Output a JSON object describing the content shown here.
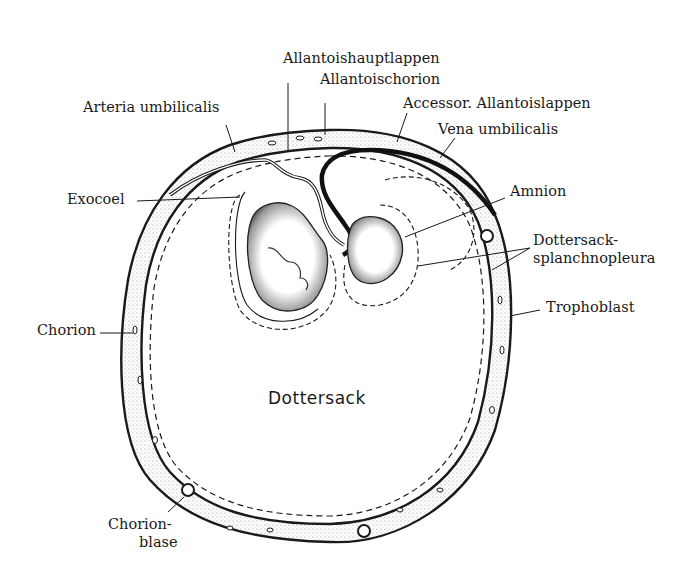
{
  "figure": {
    "type": "anatomical-section-diagram",
    "center_label": "Dottersack"
  },
  "labels": {
    "allantoishauptlappen": "Allantoishauptlappen",
    "allantoischorion": "Allantoischorion",
    "accessor_allantoislappen": "Accessor. Allantoislappen",
    "vena_umbilicalis": "Vena  umbilicalis",
    "arteria_umbilicalis": "Arteria umbilicalis",
    "exocoel": "Exocoel",
    "amnion": "Amnion",
    "dottersack_splanchnopleura_1": "Dottersack-",
    "dottersack_splanchnopleura_2": "splanchnopleura",
    "trophoblast": "Trophoblast",
    "chorion": "Chorion",
    "chorionblase_1": "Chorion-",
    "chorionblase_2": "blase",
    "dottersack": "Dottersack"
  },
  "colors": {
    "ink": "#1a1a1a",
    "stipple": "#cfcfcf",
    "background": "#ffffff"
  }
}
